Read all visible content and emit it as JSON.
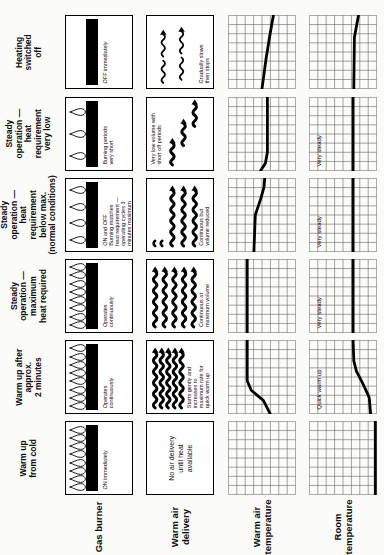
{
  "page": {
    "background": "#fbfbfa",
    "ink": "#000000"
  },
  "measurement_rows": [
    {
      "id": "gas-burner",
      "label": "Gas burner"
    },
    {
      "id": "warm-air-delivery",
      "label": "Warm air\ndelivery"
    },
    {
      "id": "warm-air-temperature",
      "label": "Warm air\ntemperature"
    },
    {
      "id": "room-temperature",
      "label": "Room\ntemperature"
    }
  ],
  "phases": [
    {
      "title": "Warm up\nfrom cold",
      "gas_burner": {
        "flames": 8,
        "bar_on": true,
        "caption": "ON immediately"
      },
      "warm_air_delivery": {
        "pattern": "none",
        "caption": "",
        "caption_pos": "bottom",
        "message": "No air delivery\nuntil heat\navailable"
      }
    },
    {
      "title": "Warm up after\napprox.\n2 minutes",
      "gas_burner": {
        "flames": 8,
        "bar_on": true,
        "caption": "Operates\ncontinuously"
      },
      "warm_air_delivery": {
        "pattern": "full",
        "caption": "Starts gently and\nincreases to\nmaximum rate for\nquick warm up",
        "caption_pos": "bottom"
      }
    },
    {
      "title": "Steady\noperation —\nmaximum\nheat required",
      "gas_burner": {
        "flames": 8,
        "bar_on": true,
        "caption": "Operates\ncontinuously"
      },
      "warm_air_delivery": {
        "pattern": "full",
        "caption": "Continuous at\nmaximum volume",
        "caption_pos": "bottom"
      }
    },
    {
      "title": "Steady\noperation —\nheat\nrequirement\nbelow max.\n(normal conditions)",
      "gas_burner": {
        "flames": 4,
        "bar_on": true,
        "caption": "ON and OFF\nBurning matches\nheat requirement —\noperating cycles 3\nminutes maximum"
      },
      "warm_air_delivery": {
        "pattern": "reduced",
        "caption": "Continuous but\nvolume reduced",
        "caption_pos": "bottom"
      }
    },
    {
      "title": "Steady\noperation —\nheat\nrequirement\nvery low",
      "gas_burner": {
        "flames": 3,
        "bar_on": true,
        "caption": "Burning periods\nvery short"
      },
      "warm_air_delivery": {
        "pattern": "very-low",
        "caption": "Very low volume with\nshort off periods",
        "caption_pos": "top"
      }
    },
    {
      "title": "Heating\nswitched\noff",
      "gas_burner": {
        "flames": 0,
        "bar_on": true,
        "caption": "OFF immediately"
      },
      "warm_air_delivery": {
        "pattern": "slowing",
        "caption": "Gradually slows\nthen stops",
        "caption_pos": "bottom"
      }
    }
  ],
  "chart_data": [
    {
      "type": "line",
      "row": "Warm air temperature",
      "phase": "Warm up from cold",
      "grid_squares": [
        8,
        8
      ],
      "x_range": [
        0,
        1
      ],
      "y_range": [
        0,
        1
      ],
      "points": [],
      "annotation": ""
    },
    {
      "type": "line",
      "row": "Warm air temperature",
      "phase": "Warm up after approx. 2 minutes",
      "grid_squares": [
        8,
        8
      ],
      "x_range": [
        0,
        1
      ],
      "y_range": [
        0,
        1
      ],
      "points": [
        [
          0,
          0.38
        ],
        [
          0.18,
          0.48
        ],
        [
          0.32,
          0.66
        ],
        [
          0.45,
          0.72
        ],
        [
          1,
          0.72
        ]
      ],
      "annotation": ""
    },
    {
      "type": "line",
      "row": "Warm air temperature",
      "phase": "Steady operation — maximum heat required",
      "grid_squares": [
        8,
        8
      ],
      "x_range": [
        0,
        1
      ],
      "y_range": [
        0,
        1
      ],
      "points": [
        [
          0,
          0.72
        ],
        [
          1,
          0.72
        ]
      ],
      "annotation": ""
    },
    {
      "type": "line",
      "row": "Warm air temperature",
      "phase": "Steady operation — heat requirement below max.",
      "grid_squares": [
        8,
        8
      ],
      "x_range": [
        0,
        1
      ],
      "y_range": [
        0,
        1
      ],
      "points": [
        [
          0,
          0.62
        ],
        [
          0.5,
          0.6
        ],
        [
          0.72,
          0.52
        ],
        [
          0.88,
          0.47
        ],
        [
          1,
          0.46
        ]
      ],
      "annotation": ""
    },
    {
      "type": "line",
      "row": "Warm air temperature",
      "phase": "Steady operation — heat requirement very low",
      "grid_squares": [
        8,
        8
      ],
      "x_range": [
        0,
        1
      ],
      "y_range": [
        0,
        1
      ],
      "points": [
        [
          0,
          0.52
        ],
        [
          0.1,
          0.45
        ],
        [
          0.25,
          0.42
        ],
        [
          1,
          0.42
        ]
      ],
      "annotation": ""
    },
    {
      "type": "line",
      "row": "Warm air temperature",
      "phase": "Heating switched off",
      "grid_squares": [
        8,
        8
      ],
      "x_range": [
        0,
        1
      ],
      "y_range": [
        0,
        1
      ],
      "points": [
        [
          0,
          0.5
        ],
        [
          0.4,
          0.44
        ],
        [
          0.75,
          0.38
        ],
        [
          1,
          0.33
        ]
      ],
      "annotation": ""
    },
    {
      "type": "line",
      "row": "Room temperature",
      "phase": "Warm up from cold",
      "grid_squares": [
        8,
        8
      ],
      "x_range": [
        0,
        1
      ],
      "y_range": [
        0,
        1
      ],
      "points": [
        [
          0,
          0.02
        ],
        [
          1,
          0.02
        ]
      ],
      "annotation": ""
    },
    {
      "type": "line",
      "row": "Room temperature",
      "phase": "Warm up after approx. 2 minutes",
      "grid_squares": [
        8,
        8
      ],
      "x_range": [
        0,
        1
      ],
      "y_range": [
        0,
        1
      ],
      "points": [
        [
          0,
          0.09
        ],
        [
          0.22,
          0.11
        ],
        [
          0.4,
          0.2
        ],
        [
          0.58,
          0.3
        ],
        [
          0.72,
          0.34
        ],
        [
          1,
          0.35
        ]
      ],
      "annotation": "Quick warm up"
    },
    {
      "type": "line",
      "row": "Room temperature",
      "phase": "Steady operation — maximum heat required",
      "grid_squares": [
        8,
        8
      ],
      "x_range": [
        0,
        1
      ],
      "y_range": [
        0,
        1
      ],
      "points": [
        [
          0,
          0.35
        ],
        [
          1,
          0.35
        ]
      ],
      "annotation": "Very steady"
    },
    {
      "type": "line",
      "row": "Room temperature",
      "phase": "Steady operation — heat requirement below max.",
      "grid_squares": [
        8,
        8
      ],
      "x_range": [
        0,
        1
      ],
      "y_range": [
        0,
        1
      ],
      "points": [
        [
          0,
          0.35
        ],
        [
          1,
          0.35
        ]
      ],
      "annotation": "Very steady"
    },
    {
      "type": "line",
      "row": "Room temperature",
      "phase": "Steady operation — heat requirement very low",
      "grid_squares": [
        8,
        8
      ],
      "x_range": [
        0,
        1
      ],
      "y_range": [
        0,
        1
      ],
      "points": [
        [
          0,
          0.35
        ],
        [
          1,
          0.35
        ]
      ],
      "annotation": "Very steady"
    },
    {
      "type": "line",
      "row": "Room temperature",
      "phase": "Heating switched off",
      "grid_squares": [
        8,
        8
      ],
      "x_range": [
        0,
        1
      ],
      "y_range": [
        0,
        1
      ],
      "points": [
        [
          0,
          0.34
        ],
        [
          0.7,
          0.33
        ],
        [
          0.9,
          0.29
        ],
        [
          1,
          0.27
        ]
      ],
      "annotation": ""
    }
  ]
}
